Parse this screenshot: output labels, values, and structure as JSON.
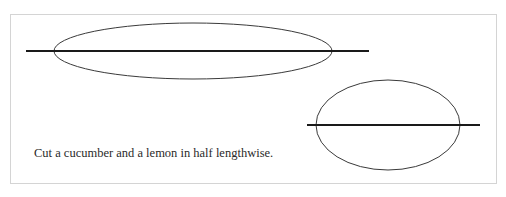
{
  "figure": {
    "caption": "Cut a cucumber and a lemon in half lengthwise.",
    "items": [
      {
        "name": "cucumber",
        "shape": "ellipse",
        "cx": 193,
        "cy": 51,
        "rx": 139,
        "ry": 28
      },
      {
        "name": "lemon",
        "shape": "ellipse",
        "cx": 388,
        "cy": 125,
        "rx": 72,
        "ry": 45
      }
    ],
    "cut_lines": [
      {
        "target": "cucumber",
        "x1": 26,
        "x2": 369,
        "y": 51
      },
      {
        "target": "lemon",
        "x1": 307,
        "x2": 480,
        "y": 125
      }
    ],
    "colors": {
      "stroke": "#3a3a3a",
      "cut_line": "#1a1a1a",
      "frame": "#d4d4d4"
    }
  }
}
